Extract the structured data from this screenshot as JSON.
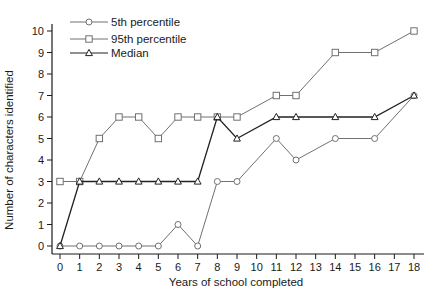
{
  "chart_data": {
    "type": "line",
    "title": "",
    "xlabel": "Years of school completed",
    "ylabel": "Number of characters identified",
    "xlim": [
      0,
      18
    ],
    "ylim": [
      0,
      10
    ],
    "x_ticks": [
      0,
      1,
      2,
      3,
      4,
      5,
      6,
      7,
      8,
      9,
      10,
      11,
      12,
      13,
      14,
      15,
      16,
      17,
      18
    ],
    "y_ticks": [
      0,
      1,
      2,
      3,
      4,
      5,
      6,
      7,
      8,
      9,
      10
    ],
    "grid": false,
    "legend_position": "top-left",
    "series": [
      {
        "name": "5th percentile",
        "marker": "circle",
        "color": "#707070",
        "x": [
          0,
          1,
          2,
          3,
          4,
          5,
          6,
          7,
          8,
          9,
          11,
          12,
          14,
          16,
          18
        ],
        "y": [
          0,
          0,
          0,
          0,
          0,
          0,
          1,
          0,
          3,
          3,
          5,
          4,
          5,
          5,
          7
        ]
      },
      {
        "name": "95th percentile",
        "marker": "square",
        "color": "#707070",
        "x": [
          0,
          1,
          2,
          3,
          4,
          5,
          6,
          7,
          8,
          9,
          11,
          12,
          14,
          16,
          18
        ],
        "y": [
          3,
          3,
          5,
          6,
          6,
          5,
          6,
          6,
          6,
          6,
          7,
          7,
          9,
          9,
          10
        ]
      },
      {
        "name": "Median",
        "marker": "triangle",
        "color": "#222222",
        "x": [
          0,
          1,
          2,
          3,
          4,
          5,
          6,
          7,
          8,
          9,
          11,
          12,
          14,
          16,
          18
        ],
        "y": [
          0,
          3,
          3,
          3,
          3,
          3,
          3,
          3,
          6,
          5,
          6,
          6,
          6,
          6,
          7
        ]
      }
    ]
  }
}
